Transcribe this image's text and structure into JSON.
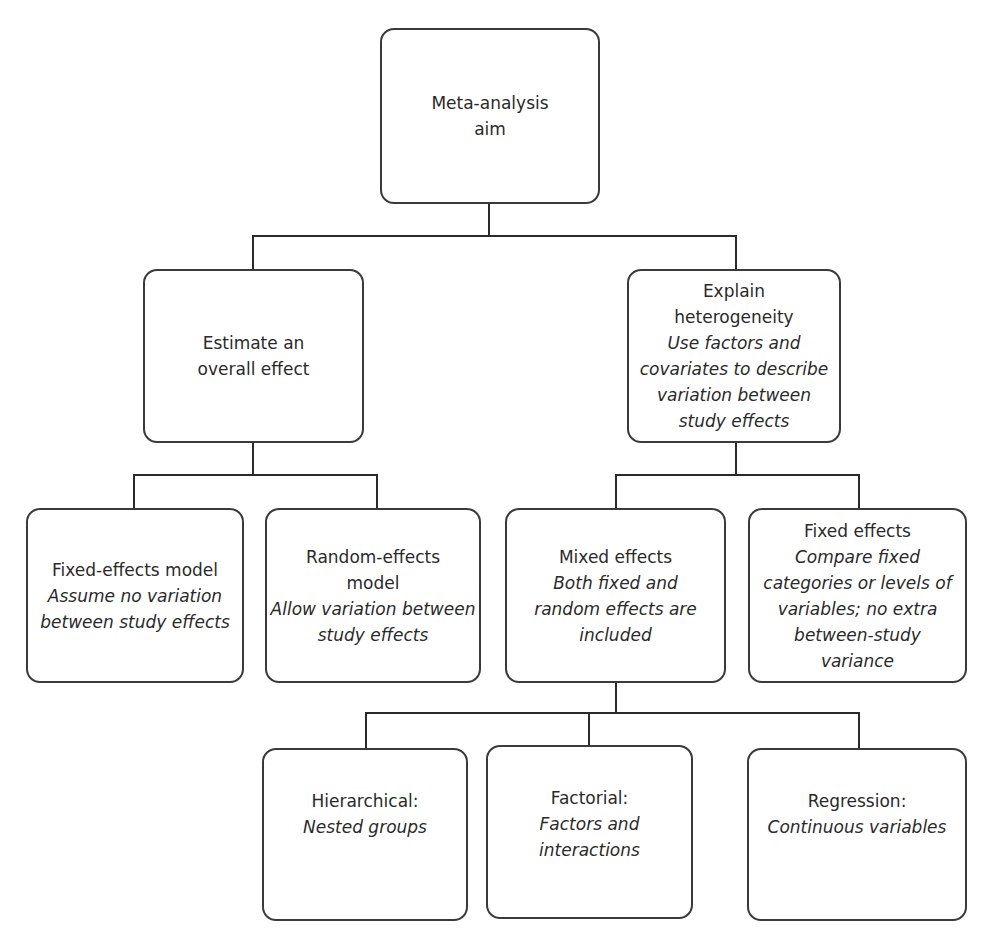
{
  "diagram": {
    "type": "hierarchy",
    "root": {
      "title": "Meta-analysis aim"
    },
    "level1": [
      {
        "title": "Estimate an overall effect",
        "description": ""
      },
      {
        "title": "Explain heterogeneity",
        "description": "Use factors and covariates to describe variation between study effects"
      }
    ],
    "level2_left": [
      {
        "title": "Fixed-effects model",
        "description": "Assume no variation between study effects"
      },
      {
        "title": "Random-effects model",
        "description": "Allow variation between study effects"
      }
    ],
    "level2_right": [
      {
        "title": "Mixed effects",
        "description": "Both fixed and random effects are included"
      },
      {
        "title": "Fixed effects",
        "description": "Compare fixed categories or levels of variables; no extra between-study variance"
      }
    ],
    "level3": [
      {
        "title": "Hierarchical:",
        "description": "Nested groups"
      },
      {
        "title": "Factorial:",
        "description": "Factors and interactions"
      },
      {
        "title": "Regression:",
        "description": "Continuous variables"
      }
    ]
  }
}
